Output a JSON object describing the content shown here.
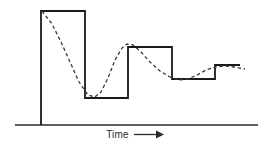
{
  "figure": {
    "axis_label": "Time",
    "arrow_icon": "right-arrow-icon",
    "line_color": "#1a1a1a",
    "dashed_color": "#3a3a3a",
    "background_color": "#ffffff"
  },
  "chart_data": {
    "type": "line",
    "title": "",
    "xlabel": "Time",
    "ylabel": "",
    "grid": false,
    "legend": "none",
    "xlim": [
      0,
      270
    ],
    "ylim": [
      149,
      0
    ],
    "annotations": [
      "Time"
    ],
    "series": [
      {
        "name": "step-response-setpoint",
        "style": "solid",
        "color": "#1a1a1a",
        "description": "Staircase set-point signal that starts at zero, jumps high, drops low, then converges upward in successively smaller steps",
        "points": [
          [
            41,
            125
          ],
          [
            41,
            11
          ],
          [
            85,
            11
          ],
          [
            85,
            98
          ],
          [
            128,
            98
          ],
          [
            128,
            47
          ],
          [
            172,
            47
          ],
          [
            172,
            79
          ],
          [
            215,
            79
          ],
          [
            215,
            65
          ],
          [
            240,
            65
          ]
        ]
      },
      {
        "name": "process-response",
        "style": "dashed",
        "color": "#3a3a3a",
        "description": "Smooth damped oscillatory response that lags and overshoots the staircase set-point, settling toward it",
        "points": [
          [
            42,
            11
          ],
          [
            52,
            24
          ],
          [
            61,
            42
          ],
          [
            70,
            62
          ],
          [
            79,
            82
          ],
          [
            88,
            95
          ],
          [
            95,
            97
          ],
          [
            101,
            92
          ],
          [
            108,
            78
          ],
          [
            115,
            60
          ],
          [
            122,
            48
          ],
          [
            127,
            44
          ],
          [
            133,
            45
          ],
          [
            141,
            52
          ],
          [
            150,
            62
          ],
          [
            160,
            71
          ],
          [
            170,
            77
          ],
          [
            179,
            80
          ],
          [
            188,
            79
          ],
          [
            197,
            75
          ],
          [
            206,
            70
          ],
          [
            215,
            67
          ],
          [
            225,
            66
          ],
          [
            234,
            67
          ],
          [
            245,
            69
          ]
        ]
      }
    ],
    "baseline": {
      "name": "time-axis",
      "x_start": 15,
      "x_end": 258,
      "y": 125
    }
  }
}
